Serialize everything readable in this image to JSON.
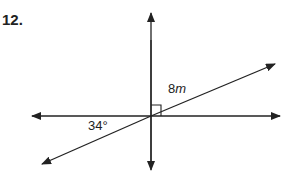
{
  "problem": {
    "number": "12."
  },
  "labels": {
    "segment_coef": "8",
    "segment_var": "m",
    "angle": "34°"
  },
  "colors": {
    "line": "#222222",
    "background": "#ffffff"
  },
  "diagram": {
    "intersection": [
      151,
      116
    ],
    "right_angle_marker": true
  }
}
